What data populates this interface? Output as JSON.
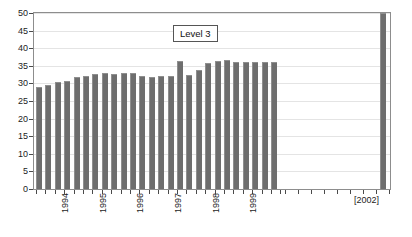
{
  "chart_data": {
    "type": "bar",
    "title": "",
    "legend_label": "Level 3",
    "legend_position": "top-center",
    "grid": true,
    "xlabel": "",
    "ylabel": "",
    "ylim": [
      0,
      50
    ],
    "y_ticks": [
      0,
      5,
      10,
      15,
      20,
      25,
      30,
      35,
      40,
      45,
      50
    ],
    "y_tick_labels": [
      "0",
      "5",
      "10",
      "15",
      "20",
      "25",
      "30",
      "35",
      "40",
      "45",
      "50"
    ],
    "x_tick_labels": [
      "1994",
      "1995",
      "1996",
      "1997",
      "1998",
      "1999",
      "[2002]"
    ],
    "bar_color": "#6e6e6e",
    "categories": [
      "1993Q3",
      "1993Q4",
      "1994Q1",
      "1994Q2",
      "1994Q3",
      "1994Q4",
      "1995Q1",
      "1995Q2",
      "1995Q3",
      "1995Q4",
      "1996Q1",
      "1996Q2",
      "1996Q3",
      "1996Q4",
      "1997Q1",
      "1997Q2",
      "1997Q3",
      "1997Q4",
      "1998Q1",
      "1998Q2",
      "1998Q3",
      "1998Q4",
      "1999Q1",
      "1999Q2",
      "1999Q3",
      "1999Q4",
      "2002"
    ],
    "values": [
      29.0,
      29.5,
      30.4,
      30.8,
      31.9,
      32.1,
      32.7,
      33.0,
      32.8,
      33.1,
      33.1,
      32.0,
      31.8,
      32.0,
      32.0,
      36.5,
      32.5,
      33.8,
      35.9,
      36.3,
      36.6,
      36.1,
      36.0,
      36.0,
      36.0,
      36.0,
      50.0
    ]
  }
}
